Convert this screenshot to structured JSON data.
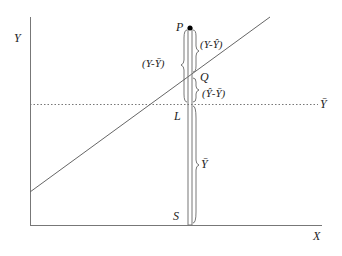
{
  "diagram": {
    "axes": {
      "y_label": "Y",
      "x_label": "X"
    },
    "mean_line": {
      "label": "Ȳ",
      "style": "dotted"
    },
    "points": {
      "P": "P",
      "Q": "Q",
      "L": "L",
      "S": "S"
    },
    "segments": {
      "residual": "(Y-Ŷ)",
      "total_deviation": "(Y-Ȳ)",
      "explained": "(Ŷ-Ȳ)",
      "mean": "Ȳ"
    },
    "colors": {
      "line": "#666666",
      "dot": "#000000",
      "text": "#222222"
    }
  }
}
